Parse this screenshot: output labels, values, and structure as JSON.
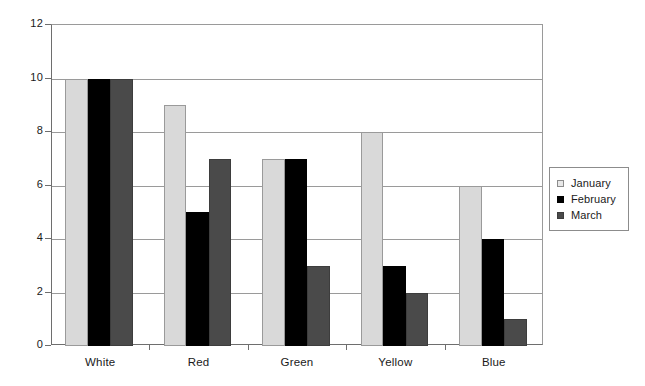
{
  "chart_data": {
    "type": "bar",
    "title": "",
    "subtitle": "",
    "xlabel": "",
    "ylabel": "",
    "categories": [
      "White",
      "Red",
      "Green",
      "Yellow",
      "Blue"
    ],
    "series": [
      {
        "name": "January",
        "color": "#d9d9d9",
        "values": [
          10,
          9,
          7,
          8,
          6
        ]
      },
      {
        "name": "February",
        "color": "#000000",
        "values": [
          10,
          5,
          7,
          3,
          4
        ]
      },
      {
        "name": "March",
        "color": "#4a4a4a",
        "values": [
          10,
          7,
          3,
          2,
          1
        ]
      }
    ],
    "ylim": [
      0,
      12
    ],
    "yticks": [
      0,
      2,
      4,
      6,
      8,
      10,
      12
    ],
    "ytick_labels": [
      "0",
      "2",
      "4",
      "6",
      "8",
      "10",
      "12"
    ],
    "grid": true,
    "grid_axis": "y",
    "legend_position": "right",
    "bar_group_count": 5,
    "bars_per_group": 3
  }
}
